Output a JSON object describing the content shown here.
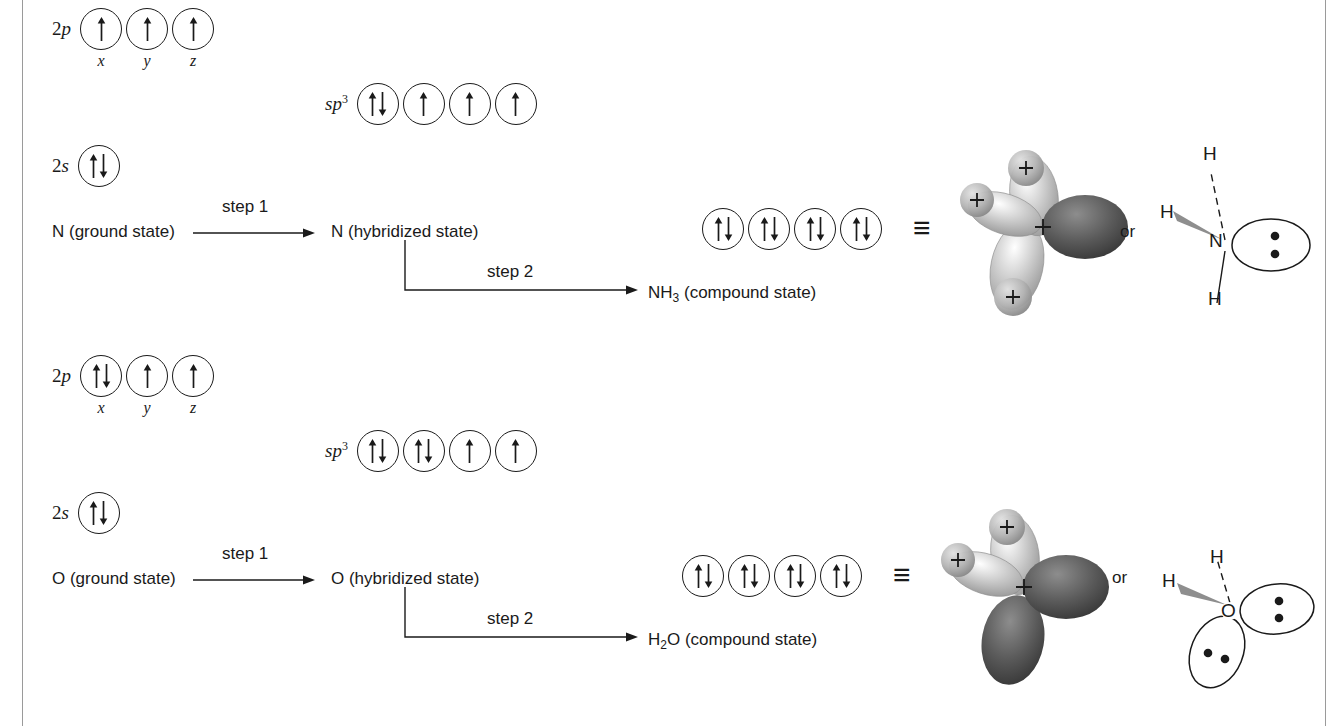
{
  "figure": {
    "kind": "orbital-hybridization-diagram",
    "rows": [
      {
        "id": "nitrogen",
        "ground_state_label": "N (ground state)",
        "hybridized_state_label": "N (hybridized state)",
        "compound_state_label": "NH3 (compound state)",
        "compound_formula_base": "NH",
        "compound_formula_sub": "3",
        "compound_formula_tail": " (compound state)",
        "step1_label": "step 1",
        "step2_label": "step 2",
        "or_label": "or",
        "equiv_symbol": "≡",
        "p_label": "2p",
        "p_label_n": "2",
        "p_label_orbital": "p",
        "s_label_n": "2",
        "s_label_orbital": "s",
        "sp3_label_base": "sp",
        "sp3_label_sup": "3",
        "p_sublabels": [
          "x",
          "y",
          "z"
        ],
        "p_occupancy": [
          "up",
          "up",
          "up"
        ],
        "s_occupancy": [
          "pair"
        ],
        "sp3_occupancy": [
          "pair",
          "up",
          "up",
          "up"
        ],
        "compound_occupancy": [
          "pair",
          "pair",
          "pair",
          "pair"
        ],
        "lewis": {
          "center_atom": "N",
          "h_top": "H",
          "h_left": "H",
          "h_bottom": "H",
          "lone_pair_count": 1,
          "dots_per_pair": 2
        },
        "orbital_model": {
          "hydrogen_lobes": 3,
          "lone_pair_lobes": 1,
          "plus_marks": 3,
          "plus_symbol": "+"
        }
      },
      {
        "id": "oxygen",
        "ground_state_label": "O (ground state)",
        "hybridized_state_label": "O (hybridized state)",
        "compound_state_label": "H2O (compound state)",
        "compound_formula_base": "H",
        "compound_formula_sub": "2",
        "compound_formula_tail": "O (compound state)",
        "step1_label": "step 1",
        "step2_label": "step 2",
        "or_label": "or",
        "equiv_symbol": "≡",
        "p_label": "2p",
        "p_label_n": "2",
        "p_label_orbital": "p",
        "s_label_n": "2",
        "s_label_orbital": "s",
        "sp3_label_base": "sp",
        "sp3_label_sup": "3",
        "p_sublabels": [
          "x",
          "y",
          "z"
        ],
        "p_occupancy": [
          "pair",
          "up",
          "up"
        ],
        "s_occupancy": [
          "pair"
        ],
        "sp3_occupancy": [
          "pair",
          "pair",
          "up",
          "up"
        ],
        "compound_occupancy": [
          "pair",
          "pair",
          "pair",
          "pair"
        ],
        "lewis": {
          "center_atom": "O",
          "h_top": "H",
          "h_left": "H",
          "lone_pair_count": 2,
          "dots_per_pair": 2
        },
        "orbital_model": {
          "hydrogen_lobes": 2,
          "lone_pair_lobes": 2,
          "plus_marks": 2,
          "plus_symbol": "+"
        }
      }
    ],
    "colors": {
      "ink": "#1a1a1a",
      "rule": "#9a9a9a",
      "lobe_light": "#bcbcbc",
      "lobe_dark": "#4a4a4a",
      "background": "#ffffff"
    }
  }
}
